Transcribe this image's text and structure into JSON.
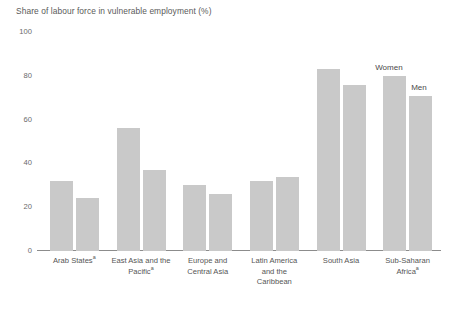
{
  "chart_data": {
    "type": "bar",
    "title": "Share of labour force in vulnerable employment (%)",
    "xlabel": "",
    "ylabel": "",
    "ylim": [
      0,
      100
    ],
    "yticks": [
      "0",
      "20",
      "40",
      "60",
      "80",
      "100"
    ],
    "grid": false,
    "legend_position": "inline-annotation",
    "categories": [
      "Arab Statesᵃ",
      "East Asia and the Pacificᵃ",
      "Europe and Central Asia",
      "Latin America and the Caribbean",
      "South Asia",
      "Sub-Saharan Africaᵃ"
    ],
    "category_lines": [
      [
        "Arab States",
        "a"
      ],
      [
        "East Asia and the",
        "Pacific",
        "a"
      ],
      [
        "Europe and",
        "Central Asia"
      ],
      [
        "Latin America",
        "and the",
        "Caribbean"
      ],
      [
        "South Asia"
      ],
      [
        "Sub-Saharan",
        "Africa",
        "a"
      ]
    ],
    "series": [
      {
        "name": "Women",
        "values": [
          32,
          56,
          30,
          32,
          83,
          80
        ]
      },
      {
        "name": "Men",
        "values": [
          24,
          37,
          26,
          34,
          76,
          71
        ]
      }
    ],
    "bar_color": "#c9c9c9",
    "axis_color": "#8c8c8c",
    "text_color": "#555555",
    "background": "#ffffff"
  },
  "annotations": {
    "women_label": "Women",
    "men_label": "Men"
  },
  "categories_display": [
    {
      "l1": "Arab States",
      "sup1": "a",
      "l2": "",
      "sup2": "",
      "l3": ""
    },
    {
      "l1": "East Asia and the",
      "sup1": "",
      "l2": "Pacific",
      "sup2": "a",
      "l3": ""
    },
    {
      "l1": "Europe and",
      "sup1": "",
      "l2": "Central Asia",
      "sup2": "",
      "l3": ""
    },
    {
      "l1": "Latin America",
      "sup1": "",
      "l2": "and the",
      "sup2": "",
      "l3": "Caribbean"
    },
    {
      "l1": "South Asia",
      "sup1": "",
      "l2": "",
      "sup2": "",
      "l3": ""
    },
    {
      "l1": "Sub-Saharan",
      "sup1": "",
      "l2": "Africa",
      "sup2": "a",
      "l3": ""
    }
  ]
}
